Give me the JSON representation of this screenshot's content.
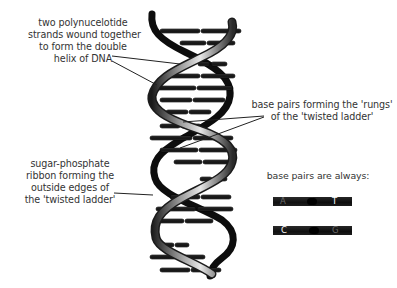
{
  "labels": {
    "strands": "two polynucelotide\nstrands wound together\nto form the double\nhelix of DNA",
    "rungs": "base pairs forming the 'rungs'\nof the 'twisted ladder'",
    "ribbon": "sugar-phosphate\nribbon forming the\noutside edges of\nthe 'twisted ladder'",
    "always": "base pairs are always:"
  },
  "base_pairs": [
    {
      "left": "A",
      "right": "T",
      "left_color": "#6a6a6a",
      "right_color": "#ffffff"
    },
    {
      "left": "C",
      "right": "G",
      "left_color": "#ffffff",
      "right_color": "#6a6a6a"
    }
  ],
  "colors": {
    "ribbon_dark": "#111111",
    "ribbon_light": "#d8d8d8",
    "rung": "#1a1a1a",
    "text": "#333333"
  }
}
